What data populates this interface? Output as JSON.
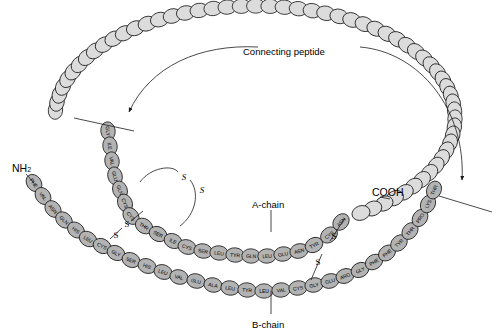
{
  "figure": {
    "title_text": "Connecting peptide",
    "a_chain_label": "A-chain",
    "b_chain_label": "B-chain",
    "n_terminus": "NH",
    "n_terminus_sub": "2",
    "c_terminus": "COOH",
    "disulfide_symbol": "S",
    "colors": {
      "chain_residue_fill": "#b3b3b3",
      "connecting_peptide_fill": "#dcdcdc",
      "outline": "#1a1a1a",
      "background": "#ffffff",
      "text": "#000000"
    }
  },
  "b_chain": {
    "name": "B-chain",
    "residues": [
      "PHE",
      "VAL",
      "ASN",
      "GLN",
      "HIS",
      "LEU",
      "CYS",
      "GLY",
      "SER",
      "HIS",
      "LEU",
      "VAL",
      "GLU",
      "ALA",
      "LEU",
      "TYR",
      "LEU",
      "VAL",
      "CYS",
      "GLY",
      "GLU",
      "ARG",
      "GLY",
      "PHE",
      "PHE",
      "TYR",
      "THR",
      "PRO",
      "LYS",
      "THR"
    ],
    "terminus_start": "NH2",
    "count": 30
  },
  "a_chain": {
    "name": "A-chain",
    "residues": [
      "GLY",
      "ILE",
      "VAL",
      "GLU",
      "GLN",
      "CYS",
      "CYS",
      "THR",
      "SER",
      "ILE",
      "CYS",
      "SER",
      "LEU",
      "TYR",
      "GLN",
      "LEU",
      "GLU",
      "ASN",
      "TYR",
      "CYS",
      "ASN"
    ],
    "terminus_end": "COOH",
    "count": 21
  },
  "connecting_peptide": {
    "name": "Connecting peptide",
    "residue_count": 58,
    "label": "Connecting peptide"
  },
  "disulfide_bonds": [
    {
      "id": "intra-a-chain",
      "from": "A6 CYS",
      "to": "A11 CYS",
      "style": "italic"
    },
    {
      "id": "interchain-left",
      "from": "B7 CYS",
      "to": "A7 CYS",
      "style": "upright"
    },
    {
      "id": "interchain-right",
      "from": "B19 CYS",
      "to": "A20 CYS",
      "style": "upright"
    }
  ],
  "cleavage_sites": [
    {
      "id": "left-cleavage",
      "description": "slash between connecting peptide and A-chain GLY"
    },
    {
      "id": "right-cleavage",
      "description": "slash between connecting peptide and B-chain THR"
    }
  ]
}
